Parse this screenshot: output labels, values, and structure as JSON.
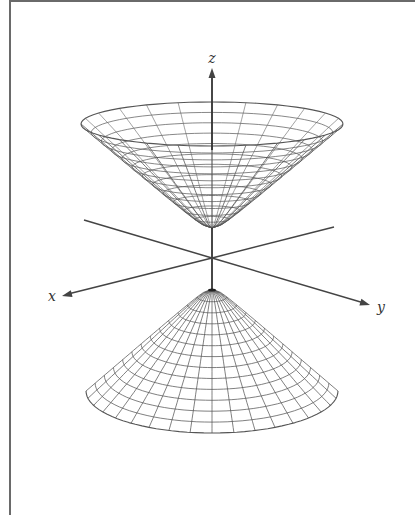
{
  "figure": {
    "axes": {
      "origin": [
        212,
        258
      ],
      "labels": {
        "x": "x",
        "y": "y",
        "z": "z"
      },
      "z_tip": [
        212,
        68
      ],
      "z_label_pos": [
        212,
        63
      ],
      "x_tip": [
        62,
        296
      ],
      "x_label_pos": [
        52,
        301
      ],
      "y_tip": [
        370,
        305
      ],
      "y_label_pos": [
        381,
        312
      ],
      "neg_y_end": [
        84,
        220
      ],
      "neg_x_end": [
        334,
        227
      ],
      "color": "#444444"
    },
    "upper_sheet": {
      "vertex": [
        212,
        228
      ],
      "rim_center": [
        212,
        124
      ],
      "rim_rx": 131,
      "rim_ry": 22,
      "meridians": 24,
      "parallels": 12
    },
    "lower_sheet": {
      "vertex": [
        212,
        289
      ],
      "rim_center": [
        212,
        391
      ],
      "rim_rx": 126,
      "rim_ry": 42,
      "meridians": 36,
      "parallels": 13
    },
    "mesh_color": "#555555"
  }
}
